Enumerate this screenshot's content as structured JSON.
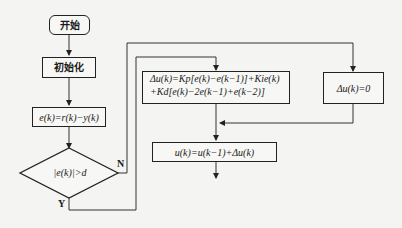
{
  "diagram": {
    "type": "flowchart",
    "nodes": {
      "start": {
        "label": "开始",
        "shape": "rounded-rect"
      },
      "init": {
        "label": "初始化",
        "shape": "rect"
      },
      "error": {
        "label": "e(k)=r(k)−y(k)",
        "shape": "rect"
      },
      "decision": {
        "label": "|e(k)|>d",
        "shape": "diamond"
      },
      "pid": {
        "line1": "Δu(k)=Kp[e(k)−e(k−1)]+Kie(k)",
        "line2": "+Kd[e(k)−2e(k−1)+e(k−2)]",
        "shape": "rect"
      },
      "zero": {
        "label": "Δu(k)=0",
        "shape": "rect"
      },
      "output": {
        "label": "u(k)=u(k−1)+Δu(k)",
        "shape": "rect"
      }
    },
    "branch_labels": {
      "yes": "Y",
      "no": "N"
    },
    "edges": [
      {
        "from": "start",
        "to": "init"
      },
      {
        "from": "init",
        "to": "error"
      },
      {
        "from": "error",
        "to": "decision"
      },
      {
        "from": "decision",
        "to": "zero",
        "label": "N"
      },
      {
        "from": "decision",
        "to": "pid",
        "label": "Y"
      },
      {
        "from": "pid",
        "to": "output"
      },
      {
        "from": "zero",
        "to": "output"
      },
      {
        "from": "output",
        "to": "next"
      }
    ]
  }
}
